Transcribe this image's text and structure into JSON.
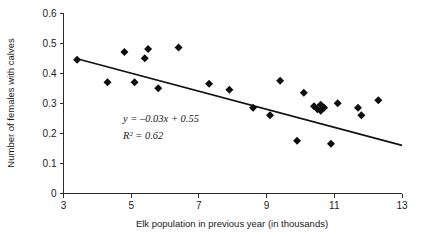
{
  "chart_data": {
    "type": "scatter",
    "title": "",
    "xlabel": "Elk population in previous year (in thousands)",
    "ylabel": "Number of females with calves",
    "xlim": [
      3,
      13
    ],
    "ylim": [
      0,
      0.6
    ],
    "xticks": [
      "3",
      "5",
      "7",
      "9",
      "11",
      "13"
    ],
    "xtick_values": [
      3,
      5,
      7,
      9,
      11,
      13
    ],
    "yticks": [
      "0",
      "0.1",
      "0.2",
      "0.3",
      "0.4",
      "0.5",
      "0.6"
    ],
    "ytick_values": [
      0,
      0.1,
      0.2,
      0.3,
      0.4,
      0.5,
      0.6
    ],
    "grid": false,
    "legend": "none",
    "marker": "diamond",
    "marker_color": "#0d0d0d",
    "line_color": "#111111",
    "axis_color": "#2b2b2b",
    "points": [
      {
        "x": 3.4,
        "y": 0.445
      },
      {
        "x": 4.3,
        "y": 0.37
      },
      {
        "x": 4.8,
        "y": 0.47
      },
      {
        "x": 5.1,
        "y": 0.37
      },
      {
        "x": 5.4,
        "y": 0.45
      },
      {
        "x": 5.5,
        "y": 0.48
      },
      {
        "x": 5.8,
        "y": 0.35
      },
      {
        "x": 6.4,
        "y": 0.485
      },
      {
        "x": 7.3,
        "y": 0.365
      },
      {
        "x": 7.9,
        "y": 0.345
      },
      {
        "x": 8.6,
        "y": 0.285
      },
      {
        "x": 9.1,
        "y": 0.26
      },
      {
        "x": 9.4,
        "y": 0.375
      },
      {
        "x": 9.9,
        "y": 0.175
      },
      {
        "x": 10.1,
        "y": 0.335
      },
      {
        "x": 10.4,
        "y": 0.29
      },
      {
        "x": 10.5,
        "y": 0.28
      },
      {
        "x": 10.6,
        "y": 0.275
      },
      {
        "x": 10.6,
        "y": 0.295
      },
      {
        "x": 10.7,
        "y": 0.285
      },
      {
        "x": 10.9,
        "y": 0.165
      },
      {
        "x": 11.1,
        "y": 0.3
      },
      {
        "x": 11.7,
        "y": 0.285
      },
      {
        "x": 11.8,
        "y": 0.26
      },
      {
        "x": 12.3,
        "y": 0.31
      }
    ],
    "trend_line": {
      "slope": -0.03,
      "intercept": 0.55,
      "x_start": 3.4,
      "x_end": 13.0
    },
    "annotations": [
      {
        "id": "equation",
        "text": "y = –0.03x + 0.55",
        "x": 6.1,
        "y": 0.262
      },
      {
        "id": "r-squared",
        "text": "R² = 0.62",
        "x": 6.1,
        "y": 0.208
      }
    ]
  },
  "labels": {
    "x_axis_title": "Elk population in previous year (in thousands)",
    "y_axis_title": "Number of females with calves",
    "equation": "y = –0.03x + 0.55",
    "r_squared": "R² = 0.62"
  }
}
